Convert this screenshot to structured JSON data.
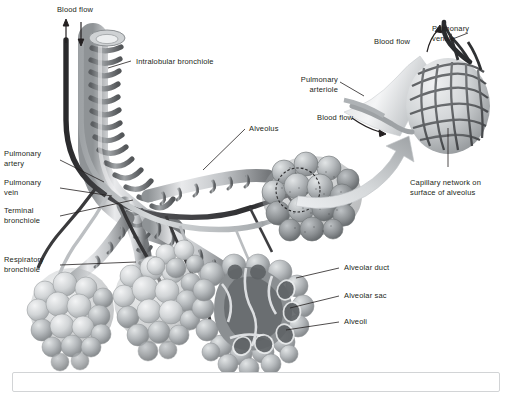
{
  "figure": {
    "style": "grayscale-airbrush-medical-illustration",
    "background_color": "#ffffff",
    "ink_color": "#231f20",
    "frame_color": "#d2d4d6"
  },
  "labels": {
    "blood_flow_top": "Blood flow",
    "intralobular_bronchiole": "Intralobular bronchiole",
    "pulmonary_artery": "Pulmonary\nartery",
    "pulmonary_vein": "Pulmonary\nvein",
    "terminal_bronchiole": "Terminal\nbronchiole",
    "respiratory_bronchiole": "Respiratory\nbronchiole",
    "alveolus": "Alveolus",
    "alveolar_duct": "Alveolar duct",
    "alveolar_sac": "Alveolar sac",
    "alveoli": "Alveoli",
    "blood_flow_inset_upper": "Blood flow",
    "blood_flow_inset_lower": "Blood flow",
    "pulmonary_venule": "Pulmonary\nvenule",
    "pulmonary_arteriole": "Pulmonary\narteriole",
    "capillary_network": "Capillary network on\nsurface of alveolus"
  },
  "colors": {
    "artery_dark": "#3a3a3c",
    "vein_light": "#b9bcbe",
    "bronchiole_band": "#6f7275",
    "bronchiole_body": "#c9ccce",
    "alveoli_light": "#d6d9db",
    "alveoli_mid": "#9b9fa2",
    "alveoli_dark": "#6a6d70",
    "capillary_mesh": "#55585b",
    "arrow_gradient_start": "#e8eaec",
    "arrow_gradient_end": "#9fa3a6"
  },
  "structures": [
    {
      "name": "intralobular-bronchiole",
      "note": "spiral smooth muscle banding, open cut end at top"
    },
    {
      "name": "pulmonary-artery",
      "note": "dark vessel, blood flow arrow upward"
    },
    {
      "name": "pulmonary-vein",
      "note": "light vessel, blood flow arrow downward"
    },
    {
      "name": "terminal-bronchiole",
      "note": "branch below intralobular bronchiole"
    },
    {
      "name": "respiratory-bronchiole",
      "note": "leads into alveolar ducts"
    },
    {
      "name": "alveolar-sac-cutaway",
      "note": "sectioned cluster showing interior lumen"
    },
    {
      "name": "alveolar-capillary-inset",
      "note": "magnified alveolus with surface capillary mesh"
    },
    {
      "name": "magnifier-circle",
      "note": "dotted circle marking magnified region"
    },
    {
      "name": "magnifier-arrow",
      "note": "large curved gradient arrow to inset"
    }
  ]
}
